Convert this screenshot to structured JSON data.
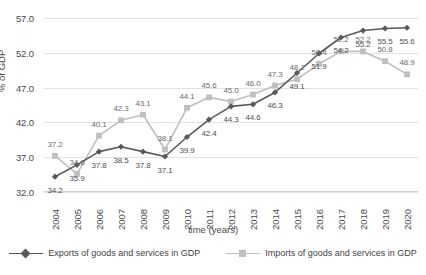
{
  "chart_data": {
    "type": "line",
    "title": "",
    "xlabel": "time (years)",
    "ylabel": "% of GDP",
    "categories": [
      "2004",
      "2005",
      "2006",
      "2007",
      "2008",
      "2009",
      "2010",
      "2011",
      "2012",
      "2013",
      "2014",
      "2015",
      "2016",
      "2017",
      "2018",
      "2019",
      "2020"
    ],
    "yticks": [
      "32.0",
      "37.0",
      "42.0",
      "47.0",
      "52.0",
      "57.0"
    ],
    "ylim": [
      32.0,
      57.0
    ],
    "grid": true,
    "legend_position": "bottom",
    "series": [
      {
        "name": "Exports of goods and services in GDP",
        "color": "#595959",
        "marker": "diamond",
        "values": [
          34.2,
          35.9,
          37.8,
          38.5,
          37.8,
          37.1,
          39.9,
          42.4,
          44.3,
          44.6,
          46.3,
          49.1,
          51.9,
          54.2,
          55.2,
          55.5,
          55.6
        ],
        "labels": [
          "34.2",
          "35.9",
          "37.8",
          "38.5",
          "37.8",
          "37.1",
          "39.9",
          "42.4",
          "44.3",
          "44.6",
          "46.3",
          "49.1",
          "51.9",
          "54.2",
          "55.2",
          "55.5",
          "55.6"
        ]
      },
      {
        "name": "Imports of goods and services in GDP",
        "color": "#bfbfbf",
        "marker": "square",
        "values": [
          37.2,
          34.6,
          40.1,
          42.3,
          43.1,
          38.1,
          44.1,
          45.6,
          45.0,
          46.0,
          47.3,
          48.2,
          50.4,
          52.2,
          52.2,
          50.8,
          48.9
        ],
        "labels": [
          "37.2",
          "34.6",
          "40.1",
          "42.3",
          "43.1",
          "38.1",
          "44.1",
          "45.6",
          "45.0",
          "46.0",
          "47.3",
          "48.2",
          "50.4",
          "52.2",
          "52.2",
          "50.8",
          "48.9"
        ]
      }
    ]
  },
  "legend": {
    "items": [
      {
        "label": "Exports of goods and services in GDP"
      },
      {
        "label": "Imports of goods and services in GDP"
      }
    ]
  }
}
